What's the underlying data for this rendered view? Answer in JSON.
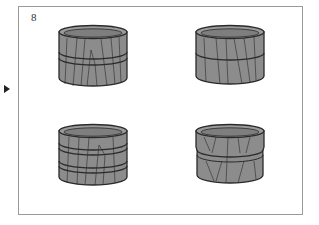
{
  "figure": {
    "number_label": "8",
    "pointer": "triangle-right-icon",
    "colors": {
      "body": "#8c8c8c",
      "top": "#9b9b9b",
      "rim_inner": "#7a7a7a",
      "outline": "#2a2a2a",
      "frame_border": "#9a9a9a"
    },
    "options": [
      {
        "id": "a",
        "bands": "single-double",
        "position": "top-left"
      },
      {
        "id": "b",
        "bands": "single",
        "position": "top-right"
      },
      {
        "id": "c",
        "bands": "double-double",
        "position": "bottom-left"
      },
      {
        "id": "d",
        "bands": "waisted",
        "position": "bottom-right"
      }
    ]
  }
}
